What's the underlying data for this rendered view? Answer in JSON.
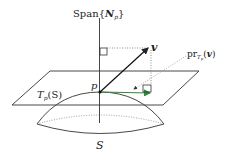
{
  "diagram": {
    "labels": {
      "span_prefix": "Span{",
      "span_N": "N",
      "span_sub": "p",
      "span_suffix": "}",
      "v": "v",
      "pr_prefix": "pr",
      "pr_sub": "T",
      "pr_subsub": "p",
      "pr_arg_open": "(",
      "pr_arg": "v",
      "pr_arg_close": ")",
      "p": "p",
      "tangent_T": "T",
      "tangent_sub": "p",
      "tangent_arg": "(S)",
      "surface": "S"
    },
    "colors": {
      "line": "#222222",
      "projection": "#2e8b3a",
      "dotted": "#888888"
    }
  }
}
